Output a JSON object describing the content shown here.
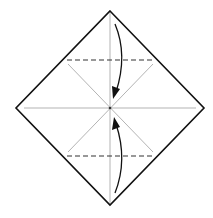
{
  "diagram": {
    "type": "origami-fold-step",
    "colors": {
      "outline": "#111111",
      "crease": "#aaaaaa",
      "fold_line": "#333333",
      "arrow": "#111111",
      "background": "#ffffff"
    },
    "folds": [
      {
        "name": "top-valley-fold",
        "style": "dashed",
        "direction": "top corner to center"
      },
      {
        "name": "bottom-valley-fold",
        "style": "dashed",
        "direction": "bottom corner to center"
      }
    ]
  }
}
